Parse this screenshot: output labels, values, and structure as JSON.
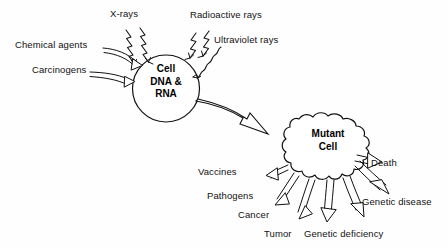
{
  "diagram": {
    "background_color": "#fefefe",
    "stroke_color": "#111111",
    "text_color": "#111111"
  },
  "source_cell": {
    "line1": "Cell",
    "line2": "DNA &",
    "line3": "RNA",
    "shape": "circle"
  },
  "mutant_cell": {
    "line1": "Mutant",
    "line2": "Cell",
    "shape": "blob"
  },
  "inputs": [
    {
      "label": "X-rays",
      "arrow_style": "zigzag"
    },
    {
      "label": "Radioactive rays",
      "arrow_style": "zigzag"
    },
    {
      "label": "Ultraviolet rays",
      "arrow_style": "wavy"
    },
    {
      "label": "Chemical agents",
      "arrow_style": "curved-open"
    },
    {
      "label": "Carcinogens",
      "arrow_style": "curved-open"
    }
  ],
  "transform_arrow": {
    "name": "mutation-arrow",
    "style": "large-hollow"
  },
  "outputs": [
    {
      "label": "Vaccines",
      "arrow_style": "open-outline"
    },
    {
      "label": "Pathogens",
      "arrow_style": "open-outline"
    },
    {
      "label": "Cancer",
      "arrow_style": "open-outline"
    },
    {
      "label": "Tumor",
      "arrow_style": "open-outline"
    },
    {
      "label": "Genetic deficiency",
      "arrow_style": "open-outline"
    },
    {
      "label": "Genetic disease",
      "arrow_style": "open-outline"
    },
    {
      "label": "Death",
      "arrow_style": "open-outline"
    }
  ]
}
